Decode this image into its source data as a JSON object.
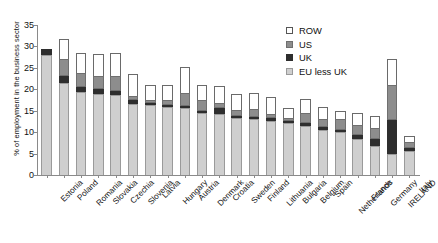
{
  "chart_data": {
    "type": "bar",
    "stacked": true,
    "title": "",
    "xlabel": "",
    "ylabel": "% of employment in the business sector",
    "ylim": [
      0,
      35
    ],
    "yticks": [
      0,
      5,
      10,
      15,
      20,
      25,
      30,
      35
    ],
    "grid": false,
    "legend_position": "top-right",
    "categories": [
      "Estonia",
      "Poland",
      "Romania",
      "Slovakia",
      "Czechia",
      "Slovenia",
      "Latvia",
      "Hungary",
      "Austria",
      "Denmark",
      "Croatia",
      "Sweden",
      "Finland",
      "Lithuania",
      "Bulgaria",
      "Belgium",
      "Spain",
      "Netherlands",
      "France",
      "Germany",
      "IRELAND",
      "Italy"
    ],
    "series": [
      {
        "name": "EU less UK",
        "color": "#cfcfcf",
        "values": [
          28.0,
          21.4,
          19.3,
          19.0,
          18.6,
          16.6,
          16.3,
          15.8,
          15.6,
          14.4,
          14.2,
          13.3,
          13.0,
          12.7,
          12.2,
          11.4,
          10.6,
          10.0,
          8.4,
          6.8,
          5.0,
          5.6
        ]
      },
      {
        "name": "UK",
        "color": "#2e2e2e",
        "values": [
          1.5,
          1.6,
          1.2,
          1.1,
          0.9,
          0.8,
          0.6,
          0.5,
          0.5,
          0.6,
          1.5,
          0.5,
          0.5,
          0.5,
          0.5,
          0.8,
          0.7,
          0.6,
          1.0,
          1.6,
          7.9,
          0.7
        ]
      },
      {
        "name": "US",
        "color": "#8d8d8d",
        "values": [
          0.0,
          4.0,
          3.2,
          3.1,
          3.5,
          1.0,
          0.7,
          1.2,
          3.0,
          2.4,
          1.2,
          1.4,
          1.8,
          1.0,
          0.5,
          2.2,
          1.7,
          2.4,
          2.3,
          2.6,
          8.2,
          1.3
        ]
      },
      {
        "name": "ROW",
        "color": "#ffffff",
        "values": [
          0.0,
          4.7,
          4.8,
          5.0,
          5.4,
          5.1,
          3.3,
          3.6,
          6.1,
          3.6,
          3.9,
          3.8,
          3.9,
          3.9,
          2.4,
          3.3,
          2.8,
          2.0,
          2.8,
          2.8,
          5.9,
          1.4
        ]
      }
    ]
  },
  "legend": {
    "items": [
      {
        "label": "ROW",
        "key": "row"
      },
      {
        "label": "US",
        "key": "us"
      },
      {
        "label": "UK",
        "key": "uk"
      },
      {
        "label": "EU less UK",
        "key": "eu"
      }
    ]
  }
}
